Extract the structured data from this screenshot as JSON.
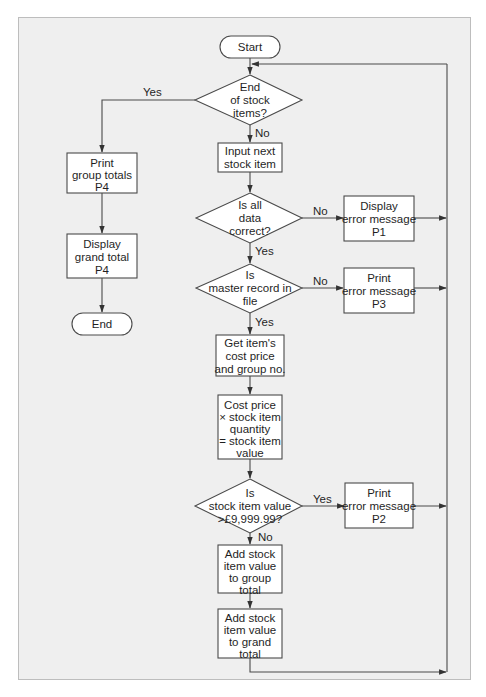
{
  "diagram": {
    "nodes": {
      "start": {
        "type": "terminator",
        "lines": [
          "Start"
        ]
      },
      "end_of_items": {
        "type": "decision",
        "lines": [
          "End",
          "of stock",
          "items?"
        ]
      },
      "input_next": {
        "type": "process",
        "lines": [
          "Input next",
          "stock item"
        ]
      },
      "data_correct": {
        "type": "decision",
        "lines": [
          "Is all",
          "data",
          "correct?"
        ]
      },
      "display_p1": {
        "type": "process",
        "lines": [
          "Display",
          "error message",
          "P1"
        ]
      },
      "master_record": {
        "type": "decision",
        "lines": [
          "Is",
          "master record in",
          "file"
        ]
      },
      "print_p3": {
        "type": "process",
        "lines": [
          "Print",
          "error message",
          "P3"
        ]
      },
      "get_cost": {
        "type": "process",
        "lines": [
          "Get item's",
          "cost price",
          "and group no."
        ]
      },
      "calc_value": {
        "type": "process",
        "lines": [
          "Cost price",
          "× stock item",
          "quantity",
          "= stock item",
          "value"
        ]
      },
      "value_check": {
        "type": "decision",
        "lines": [
          "Is",
          "stock item value",
          ">£9,999.99?"
        ]
      },
      "print_p2": {
        "type": "process",
        "lines": [
          "Print",
          "error message",
          "P2"
        ]
      },
      "add_group": {
        "type": "process",
        "lines": [
          "Add stock",
          "item value",
          "to group",
          "total"
        ]
      },
      "add_grand": {
        "type": "process",
        "lines": [
          "Add stock",
          "item value",
          "to grand",
          "total"
        ]
      },
      "print_group_totals": {
        "type": "process",
        "lines": [
          "Print",
          "group totals",
          "P4"
        ]
      },
      "display_grand_total": {
        "type": "process",
        "lines": [
          "Display",
          "grand total",
          "P4"
        ]
      },
      "end": {
        "type": "terminator",
        "lines": [
          "End"
        ]
      }
    },
    "edge_labels": {
      "end_yes": "Yes",
      "end_no": "No",
      "data_no": "No",
      "data_yes": "Yes",
      "master_no": "No",
      "master_yes": "Yes",
      "value_yes": "Yes",
      "value_no": "No"
    },
    "edges": [
      {
        "from": "start",
        "to": "end_of_items"
      },
      {
        "from": "end_of_items",
        "to": "print_group_totals",
        "label": "Yes"
      },
      {
        "from": "end_of_items",
        "to": "input_next",
        "label": "No"
      },
      {
        "from": "input_next",
        "to": "data_correct"
      },
      {
        "from": "data_correct",
        "to": "display_p1",
        "label": "No"
      },
      {
        "from": "data_correct",
        "to": "master_record",
        "label": "Yes"
      },
      {
        "from": "master_record",
        "to": "print_p3",
        "label": "No"
      },
      {
        "from": "master_record",
        "to": "get_cost",
        "label": "Yes"
      },
      {
        "from": "get_cost",
        "to": "calc_value"
      },
      {
        "from": "calc_value",
        "to": "value_check"
      },
      {
        "from": "value_check",
        "to": "print_p2",
        "label": "Yes"
      },
      {
        "from": "value_check",
        "to": "add_group",
        "label": "No"
      },
      {
        "from": "add_group",
        "to": "add_grand"
      },
      {
        "from": "display_p1",
        "to": "end_of_items",
        "via": "loop-back"
      },
      {
        "from": "print_p3",
        "to": "end_of_items",
        "via": "loop-back"
      },
      {
        "from": "print_p2",
        "to": "end_of_items",
        "via": "loop-back"
      },
      {
        "from": "add_grand",
        "to": "end_of_items",
        "via": "loop-back"
      },
      {
        "from": "print_group_totals",
        "to": "display_grand_total"
      },
      {
        "from": "display_grand_total",
        "to": "end"
      }
    ]
  }
}
